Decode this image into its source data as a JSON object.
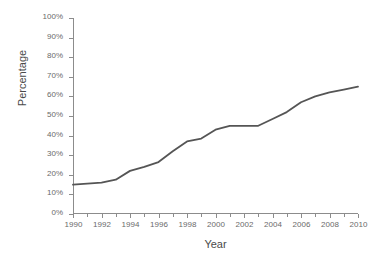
{
  "chart_data": {
    "type": "line",
    "title": "",
    "xlabel": "Year",
    "ylabel": "Percentage",
    "xlim": [
      1990,
      2010
    ],
    "ylim": [
      0,
      100
    ],
    "grid": false,
    "legend": "none",
    "line_color": "#555555",
    "axis_color": "#8c8c8c",
    "tick_label_color": "#6a6a6a",
    "y_ticks": [
      0,
      10,
      20,
      30,
      40,
      50,
      60,
      70,
      80,
      90,
      100
    ],
    "y_tick_labels": [
      "0%",
      "10%",
      "20%",
      "30%",
      "40%",
      "50%",
      "60%",
      "70%",
      "80%",
      "90%",
      "100%"
    ],
    "x_ticks": [
      1990,
      1991,
      1992,
      1993,
      1994,
      1995,
      1996,
      1997,
      1998,
      1999,
      2000,
      2001,
      2002,
      2003,
      2004,
      2005,
      2006,
      2007,
      2008,
      2009,
      2010
    ],
    "x_major_ticks": [
      1990,
      1992,
      1994,
      1996,
      1998,
      2000,
      2002,
      2004,
      2006,
      2008,
      2010
    ],
    "x_tick_labels": [
      "1990",
      "1992",
      "1994",
      "1996",
      "1998",
      "2000",
      "2002",
      "2004",
      "2006",
      "2008",
      "2010"
    ],
    "x": [
      1990,
      1991,
      1992,
      1993,
      1994,
      1995,
      1996,
      1997,
      1998,
      1999,
      2000,
      2001,
      2002,
      2003,
      2004,
      2005,
      2006,
      2007,
      2008,
      2009,
      2010
    ],
    "values": [
      15,
      15.5,
      16,
      17.5,
      22,
      24,
      26.5,
      32,
      37,
      38.5,
      43,
      45,
      45,
      45,
      48.5,
      52,
      57,
      60,
      62,
      63.5,
      65
    ],
    "series": [
      {
        "name": "Percentage",
        "values": [
          15,
          15.5,
          16,
          17.5,
          22,
          24,
          26.5,
          32,
          37,
          38.5,
          43,
          45,
          45,
          45,
          48.5,
          52,
          57,
          60,
          62,
          63.5,
          65
        ]
      }
    ]
  }
}
